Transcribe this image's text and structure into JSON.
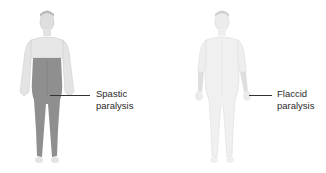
{
  "figures": [
    {
      "id": "spastic",
      "label_line1": "Spastic",
      "label_line2": "paralysis",
      "affected_region": "trunk and lower limbs",
      "colors": {
        "skin": "#e2e2e2",
        "affected": "#8f8f8f",
        "outline": "#c8c8c8"
      }
    },
    {
      "id": "flaccid",
      "label_line1": "Flaccid",
      "label_line2": "paralysis",
      "affected_region": "forearms",
      "colors": {
        "skin": "#efefef",
        "affected": "#e0e0e0",
        "outline": "#dcdcdc"
      }
    }
  ]
}
